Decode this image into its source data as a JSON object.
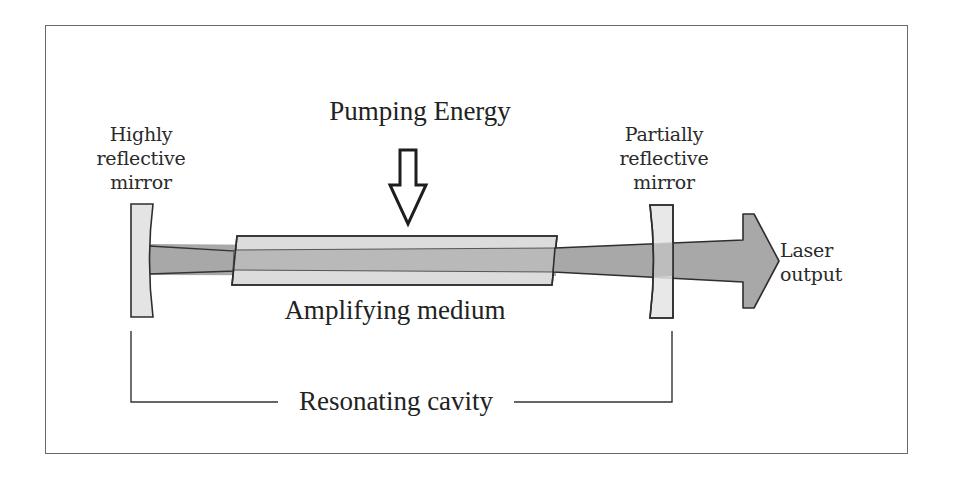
{
  "diagram": {
    "labels": {
      "pumping_energy": "Pumping Energy",
      "highly_reflective_mirror": [
        "Highly",
        "reflective",
        "mirror"
      ],
      "partially_reflective_mirror": [
        "Partially",
        "reflective",
        "mirror"
      ],
      "laser_output": [
        "Laser",
        "output"
      ],
      "amplifying_medium": "Amplifying medium",
      "resonating_cavity": "Resonating cavity"
    },
    "components": [
      {
        "id": "highly-reflective-mirror",
        "shape": "concave-mirror",
        "fill": "#e4e4e4"
      },
      {
        "id": "amplifying-medium",
        "shape": "parallelogram",
        "fill": "#dcdcdc"
      },
      {
        "id": "partially-reflective-mirror",
        "shape": "concave-mirror",
        "fill": "#e4e4e4"
      },
      {
        "id": "laser-beam",
        "shape": "tapered-beam",
        "fill": "#a8a8a8"
      },
      {
        "id": "laser-output-arrow",
        "shape": "block-arrow-right",
        "fill": "#a8a8a8"
      },
      {
        "id": "pumping-arrow",
        "shape": "hollow-arrow-down",
        "fill": "#ffffff"
      },
      {
        "id": "resonating-cavity-bracket",
        "shape": "bracket"
      }
    ],
    "colors": {
      "outline": "#2e2e2e",
      "mirror_fill": "#e4e4e4",
      "medium_fill": "#dcdcdc",
      "beam_fill": "#a8a8a8",
      "frame_border": "#6a6a6a",
      "text": "#2a2a2a"
    }
  }
}
